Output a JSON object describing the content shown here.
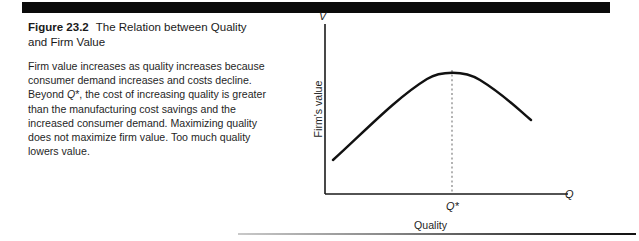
{
  "figure": {
    "number": "Figure 23.2",
    "title": "The Relation between Quality and Firm Value",
    "caption": "Firm value increases as quality increases because consumer demand increases and costs decline. Beyond Q*, the cost of increasing quality is greater than the manufacturing cost savings and the increased consumer demand. Maximizing quality does not maximize firm value. Too much quality lowers value."
  },
  "chart_data": {
    "type": "line",
    "title": "The Relation between Quality and Firm Value",
    "xlabel": "Quality",
    "ylabel": "Firm's value",
    "x_axis_symbol": "Q",
    "y_axis_symbol": "V",
    "annotations": [
      {
        "label": "Q*",
        "type": "vertical-dotted-line",
        "x": 0.58,
        "note": "optimal quality level at peak firm value"
      }
    ],
    "grid": false,
    "legend": null,
    "xlim": [
      0,
      1
    ],
    "ylim": [
      0,
      1
    ],
    "x": [
      0.04,
      0.11,
      0.19,
      0.27,
      0.35,
      0.43,
      0.5,
      0.58,
      0.66,
      0.74,
      0.82,
      0.9,
      0.98
    ],
    "y": [
      0.27,
      0.42,
      0.55,
      0.66,
      0.75,
      0.82,
      0.86,
      0.875,
      0.865,
      0.83,
      0.77,
      0.69,
      0.6
    ],
    "series": [
      {
        "name": "Firm's value",
        "values": [
          0.27,
          0.42,
          0.55,
          0.66,
          0.75,
          0.82,
          0.86,
          0.875,
          0.865,
          0.83,
          0.77,
          0.69,
          0.6
        ]
      }
    ]
  },
  "colors": {
    "rule": "#0a0a0a",
    "curve": "#111111",
    "axis": "#1a1a1a",
    "text": "#1f1f1f",
    "dotted": "#8a8a8a"
  }
}
